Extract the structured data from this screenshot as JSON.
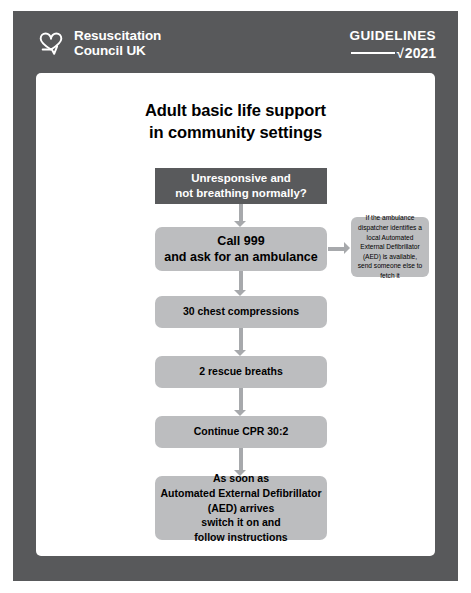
{
  "poster": {
    "frame_color": "#58595b",
    "card_color": "#ffffff"
  },
  "header": {
    "brand_name": "Resuscitation\nCouncil UK",
    "logo_icon": "heart-tick-icon",
    "guidelines_label": "GUIDELINES",
    "guidelines_tick": "√",
    "guidelines_year": "2021"
  },
  "main": {
    "title": "Adult basic life support\nin community settings"
  },
  "flowchart": {
    "nodes": [
      {
        "id": "unresponsive",
        "text": "Unresponsive and\nnot breathing normally?",
        "style": "dark",
        "color": "#595a5c",
        "text_color": "#ffffff"
      },
      {
        "id": "call-999",
        "text": "Call 999\nand ask for an ambulance",
        "style": "grey",
        "color": "#bcbdbf",
        "text_color": "#000000"
      },
      {
        "id": "aed-note",
        "text": "If the ambulance dispatcher identifies a local Automated External Defibrillator (AED) is available, send someone else to fetch it",
        "style": "note",
        "color": "#bcbdbf",
        "text_color": "#000000"
      },
      {
        "id": "chest-compressions",
        "text": "30 chest compressions",
        "style": "grey",
        "color": "#bcbdbf",
        "text_color": "#000000"
      },
      {
        "id": "rescue-breaths",
        "text": "2 rescue breaths",
        "style": "grey",
        "color": "#bcbdbf",
        "text_color": "#000000"
      },
      {
        "id": "continue-cpr",
        "text": "Continue CPR 30:2",
        "style": "grey",
        "color": "#bcbdbf",
        "text_color": "#000000"
      },
      {
        "id": "aed-arrives",
        "text": "As soon as\nAutomated External Defibrillator\n(AED) arrives\nswitch it on and\nfollow instructions",
        "style": "grey",
        "color": "#bcbdbf",
        "text_color": "#000000"
      }
    ],
    "arrow_color": "#a7a9ac"
  }
}
